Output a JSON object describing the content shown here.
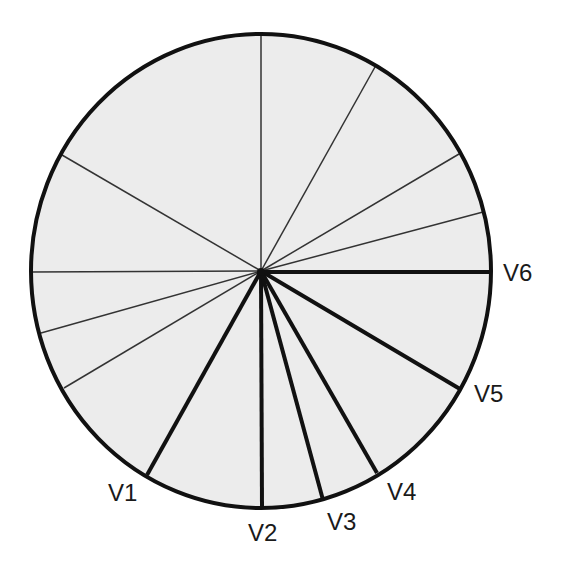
{
  "diagram": {
    "center": {
      "x": 261,
      "y": 271
    },
    "radius": {
      "rx": 230,
      "ry": 237
    },
    "colors": {
      "fill": "#ececec",
      "outline": "#111111",
      "thin_line": "#333333",
      "thick_line": "#111111",
      "label": "#1a1a1a"
    },
    "reference_rays": [
      {
        "angle_deg": -90,
        "x2": "261",
        "y2": "34"
      },
      {
        "angle_deg": -60,
        "x2": "375",
        "y2": "67"
      },
      {
        "angle_deg": -30,
        "x2": "459",
        "y2": "154"
      },
      {
        "angle_deg": -15,
        "x2": "483",
        "y2": "212"
      },
      {
        "angle_deg": -150,
        "x2": "62",
        "y2": "155"
      },
      {
        "angle_deg": 180,
        "x2": "31",
        "y2": "272"
      },
      {
        "angle_deg": 165,
        "x2": "41",
        "y2": "333"
      },
      {
        "angle_deg": 150,
        "x2": "64",
        "y2": "388"
      }
    ],
    "leads": [
      {
        "label": "V1",
        "angle_deg": 120,
        "x2": "147",
        "y2": "475",
        "label_x": "108",
        "label_y": "501"
      },
      {
        "label": "V2",
        "angle_deg": 90,
        "x2": "262",
        "y2": "508",
        "label_x": "248",
        "label_y": "541"
      },
      {
        "label": "V3",
        "angle_deg": 75,
        "x2": "323",
        "y2": "500",
        "label_x": "327",
        "label_y": "530"
      },
      {
        "label": "V4",
        "angle_deg": 60,
        "x2": "377",
        "y2": "473",
        "label_x": "387",
        "label_y": "500"
      },
      {
        "label": "V5",
        "angle_deg": 30,
        "x2": "460",
        "y2": "389",
        "label_x": "474",
        "label_y": "402"
      },
      {
        "label": "V6",
        "angle_deg": 0,
        "x2": "491",
        "y2": "272",
        "label_x": "503",
        "label_y": "281"
      }
    ]
  }
}
